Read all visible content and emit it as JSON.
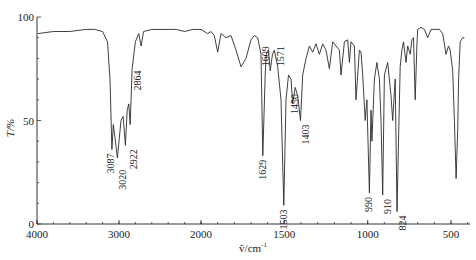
{
  "chart_data": {
    "type": "line",
    "title": "",
    "xlabel": "ṽ/cm⁻¹",
    "ylabel": "T/%",
    "xlim": [
      4000,
      400
    ],
    "ylim": [
      0,
      100
    ],
    "x_scale_note": "split scale: 4000–2000 compressed, 2000–400 expanded",
    "x_ticks": [
      4000,
      3000,
      2000,
      1500,
      1000,
      500
    ],
    "y_ticks": [
      0,
      50,
      100
    ],
    "grid": false,
    "legend": null,
    "series": [
      {
        "name": "IR spectrum",
        "points": [
          [
            3990,
            92
          ],
          [
            3800,
            93
          ],
          [
            3600,
            93
          ],
          [
            3400,
            94
          ],
          [
            3300,
            94
          ],
          [
            3200,
            93
          ],
          [
            3140,
            88
          ],
          [
            3110,
            70
          ],
          [
            3087,
            36
          ],
          [
            3070,
            48
          ],
          [
            3050,
            42
          ],
          [
            3020,
            32
          ],
          [
            3000,
            40
          ],
          [
            2975,
            50
          ],
          [
            2950,
            52
          ],
          [
            2922,
            38
          ],
          [
            2900,
            55
          ],
          [
            2880,
            58
          ],
          [
            2864,
            48
          ],
          [
            2840,
            75
          ],
          [
            2800,
            88
          ],
          [
            2760,
            92
          ],
          [
            2730,
            86
          ],
          [
            2700,
            93
          ],
          [
            2600,
            94
          ],
          [
            2500,
            94
          ],
          [
            2400,
            94
          ],
          [
            2300,
            94
          ],
          [
            2200,
            93
          ],
          [
            2100,
            94
          ],
          [
            2000,
            94
          ],
          [
            1960,
            92
          ],
          [
            1940,
            93
          ],
          [
            1920,
            91
          ],
          [
            1900,
            83
          ],
          [
            1880,
            92
          ],
          [
            1850,
            90
          ],
          [
            1820,
            91
          ],
          [
            1790,
            84
          ],
          [
            1760,
            76
          ],
          [
            1730,
            80
          ],
          [
            1700,
            89
          ],
          [
            1680,
            91
          ],
          [
            1660,
            90
          ],
          [
            1640,
            82
          ],
          [
            1629,
            33
          ],
          [
            1615,
            72
          ],
          [
            1609,
            82
          ],
          [
            1595,
            84
          ],
          [
            1585,
            74
          ],
          [
            1571,
            82
          ],
          [
            1560,
            84
          ],
          [
            1540,
            76
          ],
          [
            1520,
            60
          ],
          [
            1503,
            9
          ],
          [
            1490,
            60
          ],
          [
            1475,
            72
          ],
          [
            1460,
            70
          ],
          [
            1450,
            58
          ],
          [
            1435,
            66
          ],
          [
            1420,
            62
          ],
          [
            1403,
            50
          ],
          [
            1390,
            72
          ],
          [
            1370,
            80
          ],
          [
            1350,
            86
          ],
          [
            1330,
            83
          ],
          [
            1310,
            87
          ],
          [
            1290,
            82
          ],
          [
            1270,
            87
          ],
          [
            1250,
            84
          ],
          [
            1230,
            75
          ],
          [
            1210,
            88
          ],
          [
            1190,
            86
          ],
          [
            1170,
            84
          ],
          [
            1160,
            72
          ],
          [
            1140,
            88
          ],
          [
            1120,
            89
          ],
          [
            1110,
            78
          ],
          [
            1100,
            88
          ],
          [
            1080,
            86
          ],
          [
            1070,
            60
          ],
          [
            1050,
            84
          ],
          [
            1040,
            83
          ],
          [
            1030,
            72
          ],
          [
            1015,
            50
          ],
          [
            1005,
            60
          ],
          [
            990,
            15
          ],
          [
            980,
            55
          ],
          [
            975,
            40
          ],
          [
            960,
            70
          ],
          [
            945,
            78
          ],
          [
            930,
            70
          ],
          [
            920,
            50
          ],
          [
            910,
            14
          ],
          [
            900,
            72
          ],
          [
            880,
            78
          ],
          [
            860,
            62
          ],
          [
            850,
            50
          ],
          [
            835,
            70
          ],
          [
            824,
            6
          ],
          [
            815,
            40
          ],
          [
            805,
            76
          ],
          [
            795,
            84
          ],
          [
            785,
            88
          ],
          [
            770,
            78
          ],
          [
            760,
            86
          ],
          [
            745,
            82
          ],
          [
            735,
            89
          ],
          [
            725,
            90
          ],
          [
            715,
            60
          ],
          [
            705,
            86
          ],
          [
            700,
            94
          ],
          [
            680,
            95
          ],
          [
            660,
            94
          ],
          [
            640,
            90
          ],
          [
            620,
            94
          ],
          [
            600,
            94
          ],
          [
            570,
            94
          ],
          [
            550,
            92
          ],
          [
            530,
            82
          ],
          [
            515,
            86
          ],
          [
            505,
            84
          ],
          [
            490,
            74
          ],
          [
            480,
            50
          ],
          [
            470,
            22
          ],
          [
            460,
            45
          ],
          [
            455,
            70
          ],
          [
            445,
            88
          ],
          [
            430,
            90
          ],
          [
            420,
            90
          ]
        ]
      }
    ],
    "annotations": [
      {
        "label": "3087",
        "x": 3087,
        "y": 36
      },
      {
        "label": "3020",
        "x": 3020,
        "y": 32
      },
      {
        "label": "2922",
        "x": 2922,
        "y": 38
      },
      {
        "label": "2864",
        "x": 2864,
        "y": 48
      },
      {
        "label": "1629",
        "x": 1629,
        "y": 33
      },
      {
        "label": "1609",
        "x": 1609,
        "y": 82
      },
      {
        "label": "1571",
        "x": 1571,
        "y": 82
      },
      {
        "label": "1503",
        "x": 1503,
        "y": 9
      },
      {
        "label": "1450",
        "x": 1450,
        "y": 58
      },
      {
        "label": "1403",
        "x": 1403,
        "y": 50
      },
      {
        "label": "990",
        "x": 990,
        "y": 15
      },
      {
        "label": "910",
        "x": 910,
        "y": 14
      },
      {
        "label": "824",
        "x": 824,
        "y": 6
      }
    ]
  },
  "axis": {
    "x_title_prefix": "ṽ",
    "x_title_rest": "/cm",
    "x_title_sup": "-1",
    "y_title": "T/%"
  }
}
